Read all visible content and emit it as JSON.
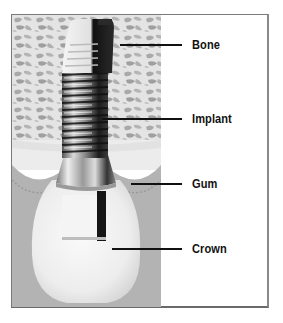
{
  "diagram": {
    "type": "dental-implant-anatomy",
    "labels": [
      {
        "id": "bone",
        "text": "Bone"
      },
      {
        "id": "implant",
        "text": "Implant"
      },
      {
        "id": "gum",
        "text": "Gum"
      },
      {
        "id": "crown",
        "text": "Crown"
      }
    ],
    "colors": {
      "bone_bg": "#c9c9c9",
      "bone_cell": "#a8a8a8",
      "gum": "#b3b3b3",
      "crown": "#f2f2f2",
      "metal_dark": "#1a1a1a",
      "metal_light": "#e8e8e8",
      "leader": "#111111",
      "border": "#7a7a7a"
    }
  }
}
